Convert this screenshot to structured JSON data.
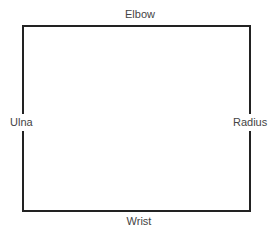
{
  "diagram": {
    "shape": "rectangle",
    "labels": {
      "top": "Elbow",
      "bottom": "Wrist",
      "left": "Ulna",
      "right": "Radius"
    }
  }
}
